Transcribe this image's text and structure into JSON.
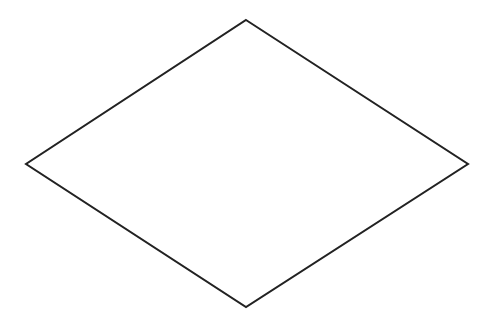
{
  "diagram": {
    "shape": "rhombus",
    "background": "#ffffff",
    "stroke": "#222222",
    "stroke_width": 2,
    "vertices": {
      "top": [
        246,
        20
      ],
      "right": [
        468,
        164
      ],
      "bottom": [
        246,
        307
      ],
      "left": [
        26,
        164
      ]
    },
    "points": "246,20 468,164 246,307 26,164",
    "label": ""
  }
}
